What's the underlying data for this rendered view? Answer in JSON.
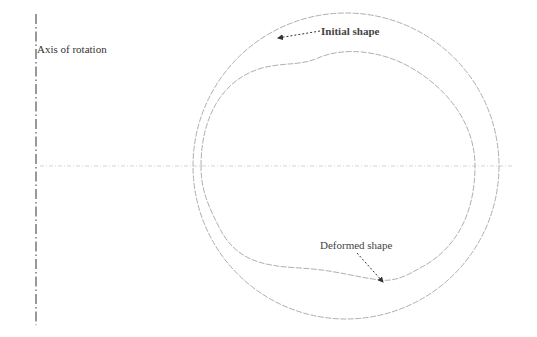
{
  "labels": {
    "axis": "Axis of rotation",
    "initial": "Initial shape",
    "deformed": "Deformed shape"
  },
  "colors": {
    "curve": "#9a9a9a",
    "axis": "#555555",
    "text": "#333333",
    "background": "#ffffff"
  },
  "geometry": {
    "axis_x": 36,
    "axis_y_range": [
      14,
      325
    ],
    "symmetry_line_y": 166,
    "symmetry_line_x_range": [
      40,
      513
    ],
    "initial_circle": {
      "cx": 346,
      "cy": 166,
      "r": 153
    }
  }
}
